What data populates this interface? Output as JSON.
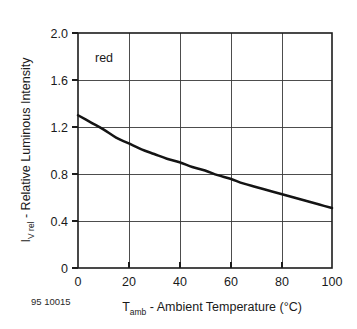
{
  "figure": {
    "caption_id": "95 10015",
    "annotation": "red",
    "background_color": "#ffffff",
    "curve_color": "#141414",
    "grid_color": "#3a3a3a"
  },
  "chart_data": {
    "type": "line",
    "title": "",
    "subtitle": "",
    "annotations": [
      "red"
    ],
    "xlabel_parts": {
      "symbol": "T",
      "subscript": "amb",
      "text": " - Ambient Temperature (°C)"
    },
    "ylabel_parts": {
      "symbol": "I",
      "subscript": "V rel",
      "text": " - Relative Luminous Intensity"
    },
    "xlabel": "T_amb - Ambient Temperature (°C)",
    "ylabel": "I_V rel - Relative Luminous Intensity",
    "xlim": [
      0,
      100
    ],
    "ylim": [
      0,
      2.0
    ],
    "xticks": [
      0,
      20,
      40,
      60,
      80,
      100
    ],
    "yticks": [
      0,
      0.4,
      0.8,
      1.2,
      1.6,
      2.0
    ],
    "xticklabels": [
      "0",
      "20",
      "40",
      "60",
      "80",
      "100"
    ],
    "yticklabels": [
      "0",
      "0.4",
      "0.8",
      "1.2",
      "1.6",
      "2.0"
    ],
    "grid": true,
    "legend": false,
    "legend_position": "none",
    "series": [
      {
        "name": "red",
        "x": [
          0,
          5,
          10,
          15,
          20,
          25,
          30,
          35,
          40,
          45,
          50,
          55,
          60,
          65,
          70,
          75,
          80,
          85,
          90,
          95,
          100
        ],
        "y": [
          1.3,
          1.24,
          1.18,
          1.11,
          1.06,
          1.01,
          0.97,
          0.93,
          0.9,
          0.86,
          0.83,
          0.79,
          0.76,
          0.72,
          0.69,
          0.66,
          0.63,
          0.6,
          0.57,
          0.54,
          0.51
        ]
      }
    ]
  }
}
